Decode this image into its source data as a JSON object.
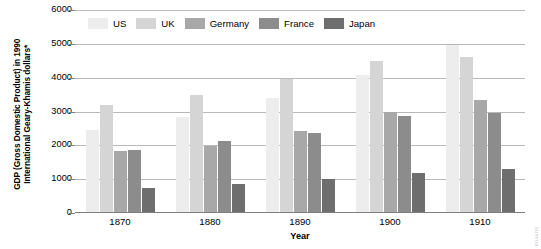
{
  "chart_data": {
    "type": "bar",
    "title": "",
    "subtitle": "",
    "xlabel": "Year",
    "ylabel": "GDP (Gross Domestic Product) in 1990 International Geary-Khamis dollars*",
    "categories": [
      "1870",
      "1880",
      "1890",
      "1900",
      "1910"
    ],
    "series": [
      {
        "name": "US",
        "color": "#ededed",
        "values": [
          2445,
          2850,
          3392,
          4091,
          4964
        ]
      },
      {
        "name": "UK",
        "color": "#d5d5d5",
        "values": [
          3190,
          3477,
          3964,
          4492,
          4611
        ]
      },
      {
        "name": "Germany",
        "color": "#a8a8a8",
        "values": [
          1839,
          1991,
          2428,
          3000,
          3348
        ]
      },
      {
        "name": "France",
        "color": "#8c8c8c",
        "values": [
          1876,
          2120,
          2376,
          2876,
          2965
        ]
      },
      {
        "name": "Japan",
        "color": "#6e6e6e",
        "values": [
          737,
          868,
          1012,
          1180,
          1304
        ]
      }
    ],
    "ylim": [
      0,
      6000
    ],
    "ytick_step": 1000,
    "yticks": [
      "6000",
      "5000",
      "4000",
      "3000",
      "2000",
      "1000",
      "0"
    ],
    "grid": true,
    "grid_axis": "y",
    "legend_position": "top-inside",
    "bar_mode": "grouped"
  },
  "axes": {
    "y_title": "GDP (Gross Domestic Product) in 1990 International Geary-Khamis dollars*",
    "x_title": "Year"
  },
  "watermark": {
    "text": "summa"
  },
  "colors": {
    "gridline": "#b9b9b9",
    "axis": "#7d7d7d",
    "text": "#000000",
    "background": "#ffffff"
  }
}
